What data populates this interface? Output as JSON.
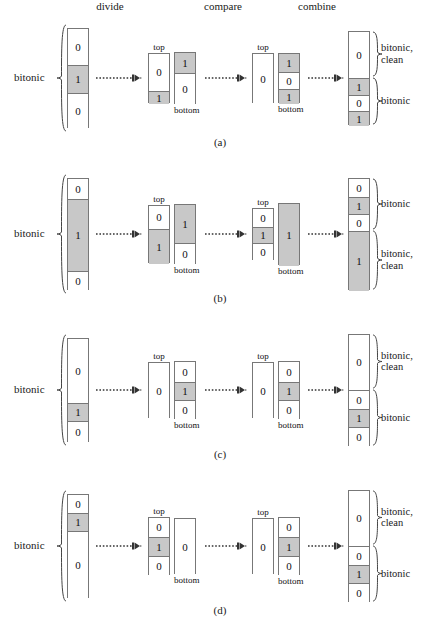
{
  "figure": {
    "stage_headers": {
      "divide": "divide",
      "compare": "compare",
      "combine": "combine"
    },
    "captions": {
      "top": "top",
      "bottom": "bottom"
    },
    "input_label": "bitonic",
    "labels": {
      "bitonic": "bitonic",
      "bitonic_clean": "bitonic,\nclean"
    },
    "colors": {
      "shaded": "#c8c8c8",
      "white": "#ffffff",
      "stroke": "#777777",
      "text": "#111111"
    }
  },
  "panels": [
    {
      "letter": "(a)",
      "input": {
        "label": "bitonic",
        "cells": [
          {
            "value": "0",
            "shaded": false,
            "h": 36
          },
          {
            "value": "1",
            "shaded": true,
            "h": 28
          },
          {
            "value": "0",
            "shaded": false,
            "h": 36
          }
        ]
      },
      "divide": {
        "top": {
          "caption": "top",
          "cells": [
            {
              "value": "0",
              "shaded": false,
              "h": 37
            },
            {
              "value": "1",
              "shaded": true,
              "h": 13
            }
          ]
        },
        "bottom": {
          "caption": "bottom",
          "cells": [
            {
              "value": "1",
              "shaded": true,
              "h": 20
            },
            {
              "value": "0",
              "shaded": false,
              "h": 32
            }
          ]
        }
      },
      "compare": {
        "top": {
          "caption": "top",
          "cells": [
            {
              "value": "0",
              "shaded": false,
              "h": 50
            }
          ]
        },
        "bottom": {
          "caption": "bottom",
          "cells": [
            {
              "value": "1",
              "shaded": true,
              "h": 18
            },
            {
              "value": "0",
              "shaded": false,
              "h": 17
            },
            {
              "value": "1",
              "shaded": true,
              "h": 15
            }
          ]
        }
      },
      "combine": {
        "cells": [
          {
            "value": "0",
            "shaded": false,
            "h": 46
          },
          {
            "value": "1",
            "shaded": true,
            "h": 17
          },
          {
            "value": "0",
            "shaded": false,
            "h": 16
          },
          {
            "value": "1",
            "shaded": true,
            "h": 15
          }
        ],
        "groups": [
          {
            "label": "bitonic,\nclean",
            "from": 0,
            "to": 0
          },
          {
            "label": "bitonic",
            "from": 1,
            "to": 3
          }
        ]
      }
    },
    {
      "letter": "(b)",
      "input": {
        "label": "bitonic",
        "cells": [
          {
            "value": "0",
            "shaded": false,
            "h": 20
          },
          {
            "value": "1",
            "shaded": true,
            "h": 72
          },
          {
            "value": "0",
            "shaded": false,
            "h": 20
          }
        ]
      },
      "divide": {
        "top": {
          "caption": "top",
          "cells": [
            {
              "value": "0",
              "shaded": false,
              "h": 23
            },
            {
              "value": "1",
              "shaded": true,
              "h": 35
            }
          ]
        },
        "bottom": {
          "caption": "bottom",
          "cells": [
            {
              "value": "1",
              "shaded": true,
              "h": 38
            },
            {
              "value": "0",
              "shaded": false,
              "h": 22
            }
          ]
        }
      },
      "compare": {
        "top": {
          "caption": "top",
          "cells": [
            {
              "value": "0",
              "shaded": false,
              "h": 18
            },
            {
              "value": "1",
              "shaded": true,
              "h": 16
            },
            {
              "value": "0",
              "shaded": false,
              "h": 18
            }
          ]
        },
        "bottom": {
          "caption": "bottom",
          "cells": [
            {
              "value": "1",
              "shaded": true,
              "h": 62
            }
          ]
        }
      },
      "combine": {
        "cells": [
          {
            "value": "0",
            "shaded": false,
            "h": 18
          },
          {
            "value": "1",
            "shaded": true,
            "h": 17
          },
          {
            "value": "0",
            "shaded": false,
            "h": 17
          },
          {
            "value": "1",
            "shaded": true,
            "h": 60
          }
        ],
        "groups": [
          {
            "label": "bitonic",
            "from": 0,
            "to": 2
          },
          {
            "label": "bitonic,\nclean",
            "from": 3,
            "to": 3
          }
        ]
      }
    },
    {
      "letter": "(c)",
      "input": {
        "label": "bitonic",
        "cells": [
          {
            "value": "0",
            "shaded": false,
            "h": 64
          },
          {
            "value": "1",
            "shaded": true,
            "h": 18
          },
          {
            "value": "0",
            "shaded": false,
            "h": 22
          }
        ]
      },
      "divide": {
        "top": {
          "caption": "top",
          "cells": [
            {
              "value": "0",
              "shaded": false,
              "h": 56
            }
          ]
        },
        "bottom": {
          "caption": "bottom",
          "cells": [
            {
              "value": "0",
              "shaded": false,
              "h": 20
            },
            {
              "value": "1",
              "shaded": true,
              "h": 18
            },
            {
              "value": "0",
              "shaded": false,
              "h": 20
            }
          ]
        }
      },
      "compare": {
        "top": {
          "caption": "top",
          "cells": [
            {
              "value": "0",
              "shaded": false,
              "h": 56
            }
          ]
        },
        "bottom": {
          "caption": "bottom",
          "cells": [
            {
              "value": "0",
              "shaded": false,
              "h": 20
            },
            {
              "value": "1",
              "shaded": true,
              "h": 18
            },
            {
              "value": "0",
              "shaded": false,
              "h": 20
            }
          ]
        }
      },
      "combine": {
        "cells": [
          {
            "value": "0",
            "shaded": false,
            "h": 55
          },
          {
            "value": "0",
            "shaded": false,
            "h": 19
          },
          {
            "value": "1",
            "shaded": true,
            "h": 18
          },
          {
            "value": "0",
            "shaded": false,
            "h": 20
          }
        ],
        "groups": [
          {
            "label": "bitonic,\nclean",
            "from": 0,
            "to": 0
          },
          {
            "label": "bitonic",
            "from": 1,
            "to": 3
          }
        ]
      }
    },
    {
      "letter": "(d)",
      "input": {
        "label": "bitonic",
        "cells": [
          {
            "value": "0",
            "shaded": false,
            "h": 18
          },
          {
            "value": "1",
            "shaded": true,
            "h": 18
          },
          {
            "value": "0",
            "shaded": false,
            "h": 68
          }
        ]
      },
      "divide": {
        "top": {
          "caption": "top",
          "cells": [
            {
              "value": "0",
              "shaded": false,
              "h": 19
            },
            {
              "value": "1",
              "shaded": true,
              "h": 19
            },
            {
              "value": "0",
              "shaded": false,
              "h": 20
            }
          ]
        },
        "bottom": {
          "caption": "bottom",
          "cells": [
            {
              "value": "0",
              "shaded": false,
              "h": 56
            }
          ]
        }
      },
      "compare": {
        "top": {
          "caption": "top",
          "cells": [
            {
              "value": "0",
              "shaded": false,
              "h": 56
            }
          ]
        },
        "bottom": {
          "caption": "bottom",
          "cells": [
            {
              "value": "0",
              "shaded": false,
              "h": 19
            },
            {
              "value": "1",
              "shaded": true,
              "h": 19
            },
            {
              "value": "0",
              "shaded": false,
              "h": 20
            }
          ]
        }
      },
      "combine": {
        "cells": [
          {
            "value": "0",
            "shaded": false,
            "h": 55
          },
          {
            "value": "0",
            "shaded": false,
            "h": 19
          },
          {
            "value": "1",
            "shaded": true,
            "h": 18
          },
          {
            "value": "0",
            "shaded": false,
            "h": 20
          }
        ],
        "groups": [
          {
            "label": "bitonic,\nclean",
            "from": 0,
            "to": 0
          },
          {
            "label": "bitonic",
            "from": 1,
            "to": 3
          }
        ]
      }
    }
  ]
}
